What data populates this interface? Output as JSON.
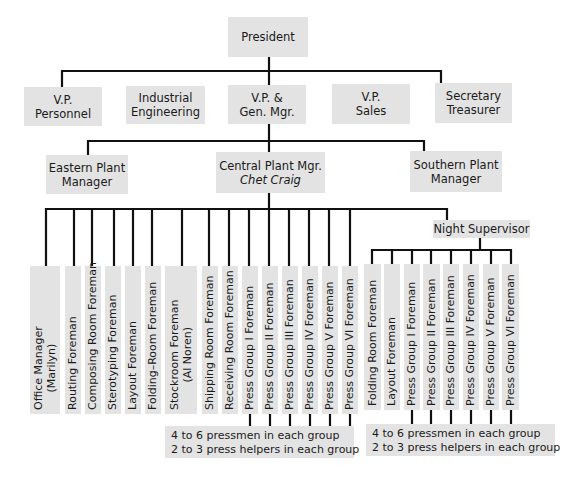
{
  "chart": {
    "president": "President",
    "executives": [
      {
        "line1": "V.P.",
        "line2": "Personnel"
      },
      {
        "line1": "Industrial",
        "line2": "Engineering"
      },
      {
        "line1": "V.P. &",
        "line2": "Gen. Mgr."
      },
      {
        "line1": "V.P.",
        "line2": "Sales"
      },
      {
        "line1": "Secretary",
        "line2": "Treasurer"
      }
    ],
    "plants": [
      {
        "line1": "Eastern Plant",
        "line2": "Manager"
      },
      {
        "line1": "Central Plant Mgr.",
        "line2": "Chet Craig"
      },
      {
        "line1": "Southern Plant",
        "line2": "Manager"
      }
    ],
    "central_reports": [
      {
        "line1": "Office Manager",
        "line2": "(Marilyn)"
      },
      {
        "line1": "Routing Foreman"
      },
      {
        "line1": "Composing Room Foreman"
      },
      {
        "line1": "Sterotyping Foreman"
      },
      {
        "line1": "Layout Foreman"
      },
      {
        "line1": "Folding–Room Foreman"
      },
      {
        "line1": "Stockroom Foreman",
        "line2": "(Al Noren)"
      },
      {
        "line1": "Shipping Room Foreman"
      },
      {
        "line1": "Receiving Room Foreman"
      },
      {
        "line1": "Press Group I Foreman"
      },
      {
        "line1": "Press Group II Foreman"
      },
      {
        "line1": "Press Group III Foreman"
      },
      {
        "line1": "Press Group IV Foreman"
      },
      {
        "line1": "Press Group V Foreman"
      },
      {
        "line1": "Press Group VI Foreman"
      }
    ],
    "night_supervisor": "Night Supervisor",
    "night_reports": [
      {
        "line1": "Folding Room Foreman"
      },
      {
        "line1": "Layout Foreman"
      },
      {
        "line1": "Press Group I Foreman"
      },
      {
        "line1": "Press Group II Foreman"
      },
      {
        "line1": "Press Group III Foreman"
      },
      {
        "line1": "Press Group IV Foreman"
      },
      {
        "line1": "Press Group V Foreman"
      },
      {
        "line1": "Press Group VI Foreman"
      }
    ],
    "day_press_note": {
      "line1": "4 to 6 pressmen in each group",
      "line2": "2 to 3 press helpers in each group"
    },
    "night_press_note": {
      "line1": "4 to 6 pressmen in each group",
      "line2": "2 to 3 press helpers in each group"
    }
  }
}
